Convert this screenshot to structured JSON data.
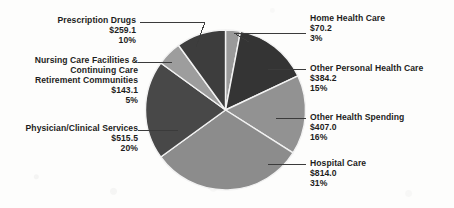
{
  "chart_data": {
    "type": "pie",
    "title": "",
    "subtitle": "",
    "xlabel": "",
    "ylabel": "",
    "legend_position": "callout-labels",
    "grid": false,
    "value_prefix": "$",
    "units": "billions",
    "total_percent": "100%",
    "categories": [
      "Home Health Care",
      "Other Personal Health Care",
      "Other Health Spending",
      "Hospital Care",
      "Physician/Clinical Services",
      "Nursing Care Facilities & Continuing Care Retirement Communities",
      "Prescription Drugs"
    ],
    "values": [
      70.2,
      384.2,
      407.0,
      814.0,
      515.5,
      143.1,
      259.1
    ],
    "percentages": [
      3,
      15,
      16,
      31,
      20,
      5,
      10
    ],
    "slices": [
      {
        "name": "Home Health Care",
        "value": 70.2,
        "value_label": "$70.2",
        "percent": 3,
        "percent_label": "3%",
        "color": "#9a9a9a",
        "start_deg": 0,
        "sweep_deg": 10.8,
        "label_side": "right"
      },
      {
        "name": "Other Personal Health Care",
        "value": 384.2,
        "value_label": "$384.2",
        "percent": 15,
        "percent_label": "15%",
        "color": "#343434",
        "start_deg": 10.8,
        "sweep_deg": 54.0,
        "label_side": "right"
      },
      {
        "name": "Other Health Spending",
        "value": 407.0,
        "value_label": "$407.0",
        "percent": 16,
        "percent_label": "16%",
        "color": "#929292",
        "start_deg": 64.8,
        "sweep_deg": 57.6,
        "label_side": "right"
      },
      {
        "name": "Hospital Care",
        "value": 814.0,
        "value_label": "$814.0",
        "percent": 31,
        "percent_label": "31%",
        "color": "#8c8c8c",
        "start_deg": 122.4,
        "sweep_deg": 111.6,
        "label_side": "right"
      },
      {
        "name": "Physician/Clinical Services",
        "value": 515.5,
        "value_label": "$515.5",
        "percent": 20,
        "percent_label": "20%",
        "color": "#484848",
        "start_deg": 234.0,
        "sweep_deg": 72.0,
        "label_side": "left"
      },
      {
        "name": "Nursing Care Facilities & Continuing Care Retirement Communities",
        "value": 143.1,
        "value_label": "$143.1",
        "percent": 5,
        "percent_label": "5%",
        "color": "#9d9d9d",
        "start_deg": 306.0,
        "sweep_deg": 18.0,
        "label_side": "left"
      },
      {
        "name": "Prescription Drugs",
        "value": 259.1,
        "value_label": "$259.1",
        "percent": 10,
        "percent_label": "10%",
        "color": "#3d3d3d",
        "start_deg": 324.0,
        "sweep_deg": 36.0,
        "label_side": "left"
      }
    ]
  },
  "labels": {
    "home_health_care": {
      "name": "Home Health Care",
      "value": "$70.2",
      "percent": "3%"
    },
    "other_personal_health_care": {
      "name": "Other Personal Health Care",
      "value": "$384.2",
      "percent": "15%"
    },
    "other_health_spending": {
      "name": "Other Health Spending",
      "value": "$407.0",
      "percent": "16%"
    },
    "hospital_care": {
      "name": "Hospital Care",
      "value": "$814.0",
      "percent": "31%"
    },
    "physician_clinical_services": {
      "name": "Physician/Clinical Services",
      "value": "$515.5",
      "percent": "20%"
    },
    "nursing_care": {
      "name_line1": "Nursing Care Facilities &",
      "name_line2": "Continuing Care",
      "name_line3": "Retirement Communities",
      "value": "$143.1",
      "percent": "5%"
    },
    "prescription_drugs": {
      "name": "Prescription Drugs",
      "value": "$259.1",
      "percent": "10%"
    }
  },
  "style": {
    "background": "#fdfdfc",
    "text_color": "#1d1d1d",
    "leader_line_color": "#3b3b3b",
    "slice_separator": "#f2f2f2"
  }
}
